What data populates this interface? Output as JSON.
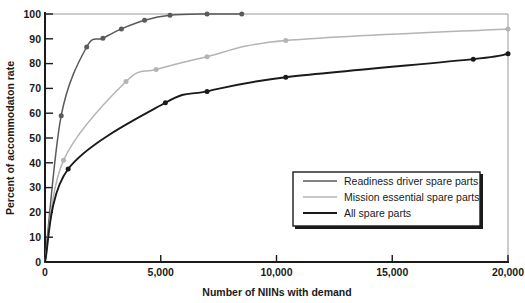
{
  "chart_data": {
    "type": "line",
    "title": "",
    "xlabel": "Number of NIINs with demand",
    "ylabel": "Percent of accommodaton rate",
    "xlim": [
      0,
      20000
    ],
    "ylim": [
      0,
      100
    ],
    "xticks": [
      0,
      5000,
      10000,
      15000,
      20000
    ],
    "xtick_labels": [
      "0",
      "5,000",
      "10,000",
      "15,000",
      "20,000"
    ],
    "yticks": [
      0,
      10,
      20,
      30,
      40,
      50,
      60,
      70,
      80,
      90,
      100
    ],
    "ytick_labels": [
      "0",
      "10",
      "20",
      "30",
      "40",
      "50",
      "60",
      "70",
      "80",
      "90",
      "100"
    ],
    "grid": false,
    "legend_position": "lower right",
    "series": [
      {
        "name": "Readiness driver spare parts",
        "color": "#5a5a5a",
        "marker": "circle",
        "x": [
          0,
          700,
          1800,
          2500,
          3300,
          4300,
          5400,
          7000,
          8500
        ],
        "y": [
          0,
          59,
          86.7,
          90.2,
          94,
          97.5,
          99.5,
          100,
          100
        ]
      },
      {
        "name": "Mission essential spare parts",
        "color": "#b4b4b4",
        "marker": "circle",
        "x": [
          0,
          800,
          3500,
          4800,
          7000,
          10400,
          20000
        ],
        "y": [
          0,
          41,
          72.8,
          77.6,
          82.8,
          89.3,
          94
        ]
      },
      {
        "name": "All spare parts",
        "color": "#1a1a1a",
        "marker": "circle",
        "x": [
          0,
          1000,
          5200,
          7000,
          10400,
          18500,
          20000
        ],
        "y": [
          0,
          37.5,
          64.2,
          68.8,
          74.5,
          81.8,
          84
        ]
      }
    ]
  },
  "legend": {
    "items": [
      {
        "label": "Readiness driver spare parts",
        "color": "#5a5a5a"
      },
      {
        "label": "Mission essential spare parts",
        "color": "#b4b4b4"
      },
      {
        "label": "All spare parts",
        "color": "#1a1a1a"
      }
    ]
  }
}
